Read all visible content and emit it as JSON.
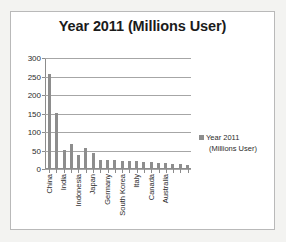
{
  "chart_data": {
    "type": "bar",
    "title": "Year 2011 (Millions User)",
    "xlabel": "",
    "ylabel": "",
    "ylim": [
      0,
      300
    ],
    "yticks": [
      0,
      50,
      100,
      150,
      200,
      250,
      300
    ],
    "ytick_labels": [
      "0",
      "50",
      "100",
      "150",
      "200",
      "250",
      "300"
    ],
    "grid": true,
    "legend_position": "right",
    "legend_entries": [
      "Year 2011 (Millions User)"
    ],
    "bar_color": "#8d8d8d",
    "categories": [
      "China",
      "",
      "India",
      "",
      "Indonesia",
      "",
      "Japan",
      "",
      "Germany",
      "",
      "South Korea",
      "",
      "Italy",
      "",
      "Canada",
      "",
      "Australia",
      "",
      "",
      ""
    ],
    "tick_labels_visible": [
      "China",
      "India",
      "Indonesia",
      "Japan",
      "Germany",
      "South Korea",
      "Italy",
      "Canada",
      "Australia"
    ],
    "values": [
      255,
      148,
      50,
      65,
      35,
      53,
      40,
      23,
      23,
      22,
      20,
      19,
      18,
      16,
      15,
      14,
      13,
      12,
      11,
      7
    ],
    "series": [
      {
        "name": "Year 2011 (Millions User)",
        "values": [
          255,
          148,
          50,
          65,
          35,
          53,
          40,
          23,
          23,
          22,
          20,
          19,
          18,
          16,
          15,
          14,
          13,
          12,
          11,
          7
        ]
      }
    ]
  },
  "legend": {
    "line1": "Year 2011",
    "line2": "(Millions User)"
  }
}
